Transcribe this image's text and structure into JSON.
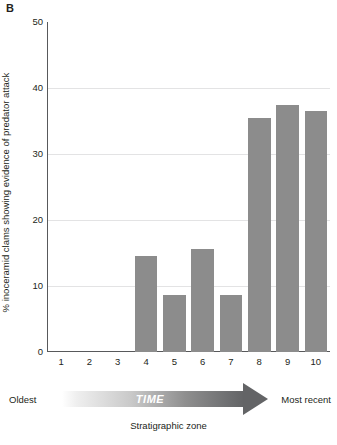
{
  "figure": {
    "panel_letter": "B"
  },
  "chart_data": {
    "type": "bar",
    "title": "",
    "xlabel": "Stratigraphic zone",
    "ylabel": "% inoceramid clams showing evidence of predator attack",
    "categories": [
      "1",
      "2",
      "3",
      "4",
      "5",
      "6",
      "7",
      "8",
      "9",
      "10"
    ],
    "values": [
      0,
      0,
      0,
      14.5,
      8.7,
      15.6,
      8.7,
      35.5,
      37.5,
      36.5
    ],
    "ylim": [
      0,
      50
    ],
    "yticks": [
      0,
      10,
      20,
      30,
      40,
      50
    ],
    "ytick_labels": [
      "0",
      "10",
      "20",
      "30",
      "40",
      "50"
    ],
    "grid": true,
    "legend": null,
    "bar_color": "#8c8c8c",
    "axis_color": "#58595b",
    "grid_color": "#e3e3e4"
  },
  "axis_annotations": {
    "time_label": "TIME",
    "oldest_label": "Oldest",
    "most_recent_label": "Most recent",
    "strat_zone_label": "Stratigraphic zone"
  }
}
